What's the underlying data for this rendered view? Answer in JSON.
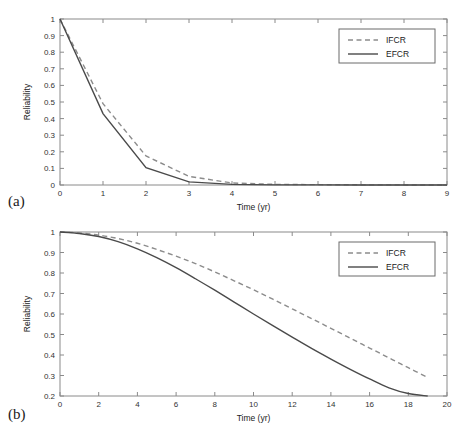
{
  "figure": {
    "background": "#ffffff",
    "panels": [
      {
        "label": "(a)",
        "xlabel": "Time (yr)",
        "ylabel": "Reliability"
      },
      {
        "label": "(b)",
        "xlabel": "Time (yr)",
        "ylabel": "Reliability"
      }
    ]
  },
  "legend": {
    "ifcr_label": "IFCR",
    "efcr_label": "EFCR",
    "ifcr_color": "#8c8c8c",
    "efcr_color": "#4a4a4a",
    "position": "top-right"
  },
  "chart_data": [
    {
      "type": "line",
      "panel": "(a)",
      "title": "",
      "xlabel": "Time (yr)",
      "ylabel": "Reliability",
      "xlim": [
        0,
        9
      ],
      "ylim": [
        0,
        1
      ],
      "xticks": [
        0,
        1,
        2,
        3,
        4,
        5,
        6,
        7,
        8,
        9
      ],
      "xticklabels": [
        "0",
        "1",
        "2",
        "3",
        "4",
        "5",
        "6",
        "7",
        "8",
        "9"
      ],
      "yticks": [
        0,
        0.1,
        0.2,
        0.3,
        0.4,
        0.5,
        0.6,
        0.7,
        0.8,
        0.9,
        1
      ],
      "yticklabels": [
        "0",
        "0.1",
        "0.2",
        "0.3",
        "0.4",
        "0.5",
        "0.6",
        "0.7",
        "0.8",
        "0.9",
        "1"
      ],
      "grid": false,
      "legend_position": "top-right",
      "x": [
        0,
        1,
        2,
        3,
        4,
        5,
        6,
        7,
        8,
        9
      ],
      "series": [
        {
          "name": "IFCR",
          "style": "dashed",
          "color": "#8c8c8c",
          "values": [
            1.0,
            0.49,
            0.175,
            0.052,
            0.012,
            0.004,
            0.002,
            0.001,
            0.0005,
            0.0
          ]
        },
        {
          "name": "EFCR",
          "style": "solid",
          "color": "#4a4a4a",
          "values": [
            1.0,
            0.43,
            0.105,
            0.019,
            0.004,
            0.001,
            0.0005,
            0.0003,
            0.0002,
            0.0
          ]
        }
      ]
    },
    {
      "type": "line",
      "panel": "(b)",
      "title": "",
      "xlabel": "Time (yr)",
      "ylabel": "Reliability",
      "xlim": [
        0,
        20
      ],
      "ylim": [
        0.2,
        1
      ],
      "xticks": [
        0,
        2,
        4,
        6,
        8,
        10,
        12,
        14,
        16,
        18,
        20
      ],
      "xticklabels": [
        "0",
        "2",
        "4",
        "6",
        "8",
        "10",
        "12",
        "14",
        "16",
        "18",
        "20"
      ],
      "yticks": [
        0.2,
        0.3,
        0.4,
        0.5,
        0.6,
        0.7,
        0.8,
        0.9,
        1
      ],
      "yticklabels": [
        "0.2",
        "0.3",
        "0.4",
        "0.5",
        "0.6",
        "0.7",
        "0.8",
        "0.9",
        "1"
      ],
      "grid": false,
      "legend_position": "top-right",
      "x": [
        0,
        1,
        2,
        3,
        4,
        5,
        6,
        7,
        8,
        9,
        10,
        11,
        12,
        13,
        14,
        15,
        16,
        17,
        18,
        19
      ],
      "series": [
        {
          "name": "IFCR",
          "style": "dashed",
          "color": "#8c8c8c",
          "values": [
            1.0,
            0.995,
            0.985,
            0.968,
            0.945,
            0.915,
            0.882,
            0.846,
            0.805,
            0.762,
            0.718,
            0.672,
            0.625,
            0.578,
            0.53,
            0.482,
            0.434,
            0.386,
            0.338,
            0.29
          ]
        },
        {
          "name": "EFCR",
          "style": "solid",
          "color": "#4a4a4a",
          "values": [
            1.0,
            0.993,
            0.978,
            0.953,
            0.918,
            0.875,
            0.826,
            0.772,
            0.716,
            0.658,
            0.6,
            0.543,
            0.487,
            0.432,
            0.38,
            0.33,
            0.283,
            0.24,
            0.212,
            0.2
          ]
        }
      ]
    }
  ]
}
